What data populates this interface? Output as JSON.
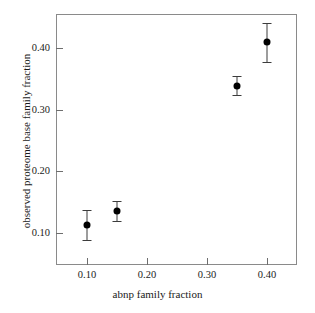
{
  "chart_data": {
    "type": "scatter",
    "title": "",
    "xlabel": "abnp family fraction",
    "ylabel": "observed proteome base family fraction",
    "xlim": [
      0.0483,
      0.45
    ],
    "ylim": [
      0.0481,
      0.4551
    ],
    "grid": false,
    "legend": null,
    "xticks": [
      "0.10",
      "0.20",
      "0.30",
      "0.40"
    ],
    "xtick_values": [
      0.1,
      0.2,
      0.3,
      0.4
    ],
    "yticks": [
      "0.10",
      "0.20",
      "0.30",
      "0.40"
    ],
    "ytick_values": [
      0.1,
      0.2,
      0.3,
      0.4
    ],
    "series": [
      {
        "name": "observed proteome base family fraction",
        "marker": "filled-circle",
        "color": "#000000",
        "errorbars": true,
        "points": [
          {
            "x": 0.1,
            "y": 0.113,
            "yerr": 0.024
          },
          {
            "x": 0.15,
            "y": 0.136,
            "yerr": 0.016
          },
          {
            "x": 0.35,
            "y": 0.339,
            "yerr": 0.016
          },
          {
            "x": 0.4,
            "y": 0.409,
            "yerr": 0.032
          }
        ]
      }
    ]
  },
  "style": {
    "frame_color": "#8a8a8a",
    "tick_color": "#6e6e6e",
    "text_color": "#1a1a1a",
    "background": "#ffffff",
    "marker_color": "#000000",
    "errorbar_color": "#3c3c3c"
  }
}
